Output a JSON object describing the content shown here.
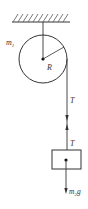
{
  "diagram": {
    "labels": {
      "pulley_mass": "m",
      "pulley_mass_sub": "1",
      "radius": "R",
      "tension_rope": "T",
      "tension_block": "T",
      "block_weight": "m",
      "block_weight_sub": "2",
      "block_weight_g": "g"
    },
    "colors": {
      "stroke": "#333333",
      "background": "#ffffff"
    }
  }
}
